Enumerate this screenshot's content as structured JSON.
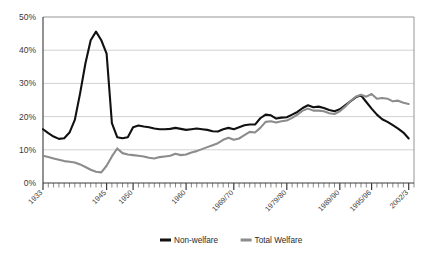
{
  "chart_data": {
    "type": "line",
    "title": "",
    "subtitle": "",
    "xlabel": "",
    "ylabel": "",
    "grid": true,
    "legend_position": "bottom",
    "ylim": [
      0,
      50
    ],
    "ytick_labels": [
      "0%",
      "10%",
      "20%",
      "30%",
      "40%",
      "50%"
    ],
    "ytick_values": [
      0,
      10,
      20,
      30,
      40,
      50
    ],
    "xlim": [
      1933,
      2003
    ],
    "xtick_labels": [
      "1933",
      "1945",
      "1950",
      "1960",
      "1969/70",
      "1979/80",
      "1989/90",
      "1995/96",
      "2002/3"
    ],
    "xtick_values": [
      1933,
      1945,
      1950,
      1960,
      1969,
      1979,
      1989,
      1995,
      2002
    ],
    "x": [
      1933,
      1934,
      1935,
      1936,
      1937,
      1938,
      1939,
      1940,
      1941,
      1942,
      1943,
      1944,
      1945,
      1946,
      1947,
      1948,
      1949,
      1950,
      1951,
      1952,
      1953,
      1954,
      1955,
      1956,
      1957,
      1958,
      1959,
      1960,
      1961,
      1962,
      1963,
      1964,
      1965,
      1966,
      1967,
      1968,
      1969,
      1970,
      1971,
      1972,
      1973,
      1974,
      1975,
      1976,
      1977,
      1978,
      1979,
      1980,
      1981,
      1982,
      1983,
      1984,
      1985,
      1986,
      1987,
      1988,
      1989,
      1990,
      1991,
      1992,
      1993,
      1994,
      1995,
      1996,
      1997,
      1998,
      1999,
      2000,
      2001,
      2002
    ],
    "series": [
      {
        "name": "Non-welfare",
        "color": "#111111",
        "values": [
          16.2,
          15.0,
          14.0,
          13.3,
          13.5,
          15.2,
          19.0,
          27.0,
          36.0,
          43.0,
          45.6,
          43.0,
          39.0,
          18.0,
          13.8,
          13.5,
          13.8,
          16.8,
          17.3,
          17.0,
          16.8,
          16.4,
          16.2,
          16.2,
          16.3,
          16.6,
          16.3,
          16.0,
          16.2,
          16.4,
          16.2,
          16.0,
          15.6,
          15.5,
          16.2,
          16.6,
          16.2,
          16.8,
          17.4,
          17.6,
          17.6,
          19.5,
          20.6,
          20.4,
          19.4,
          19.7,
          19.8,
          20.6,
          21.4,
          22.6,
          23.4,
          22.8,
          23.0,
          22.6,
          22.0,
          21.6,
          22.2,
          23.4,
          24.6,
          25.8,
          26.4,
          24.4,
          22.4,
          20.6,
          19.2,
          18.4,
          17.4,
          16.4,
          15.2,
          13.4
        ]
      },
      {
        "name": "Total Welfare",
        "color": "#8c8c8c",
        "values": [
          8.2,
          7.8,
          7.4,
          7.0,
          6.6,
          6.4,
          6.2,
          5.6,
          4.8,
          4.0,
          3.4,
          3.2,
          5.2,
          8.0,
          10.4,
          9.0,
          8.6,
          8.4,
          8.2,
          8.0,
          7.6,
          7.4,
          7.8,
          8.0,
          8.2,
          8.8,
          8.4,
          8.6,
          9.2,
          9.6,
          10.2,
          10.8,
          11.4,
          12.0,
          13.0,
          13.6,
          13.0,
          13.4,
          14.4,
          15.4,
          15.2,
          16.6,
          18.4,
          18.6,
          18.2,
          18.6,
          18.8,
          19.6,
          20.6,
          21.8,
          22.4,
          21.8,
          21.8,
          21.6,
          21.0,
          20.8,
          21.6,
          23.0,
          24.6,
          26.0,
          26.6,
          26.0,
          26.8,
          25.4,
          25.6,
          25.4,
          24.6,
          24.8,
          24.2,
          23.8
        ]
      }
    ]
  },
  "legend": {
    "items": [
      {
        "label": "Non-welfare",
        "color": "#111111"
      },
      {
        "label": "Total Welfare",
        "color": "#8c8c8c"
      }
    ]
  }
}
